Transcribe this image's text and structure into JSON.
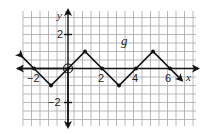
{
  "chart_data": {
    "type": "line",
    "title": "",
    "function_label": "g",
    "xlabel": "x",
    "ylabel": "y",
    "xlim": [
      -2.7,
      7.5
    ],
    "ylim": [
      -3.4,
      3.4
    ],
    "grid": true,
    "x_tick_labels": [
      "-2",
      "2",
      "4",
      "6"
    ],
    "y_tick_labels": [
      "2",
      "-2"
    ],
    "series": [
      {
        "name": "g",
        "points": [
          {
            "x": -2,
            "y": 0
          },
          {
            "x": -1,
            "y": -1
          },
          {
            "x": 0,
            "y": 0
          },
          {
            "x": 1,
            "y": 1
          },
          {
            "x": 2,
            "y": 0
          },
          {
            "x": 3,
            "y": -1
          },
          {
            "x": 4,
            "y": 0
          },
          {
            "x": 5,
            "y": 1
          },
          {
            "x": 6,
            "y": 0
          }
        ],
        "open_points": [
          {
            "x": 0,
            "y": 0
          }
        ],
        "arrows": [
          "left-up",
          "right-down"
        ]
      }
    ],
    "annotations": [
      {
        "text": "g",
        "x": 3.3,
        "y": 1.6
      }
    ]
  },
  "labels": {
    "x_axis": "x",
    "y_axis": "y",
    "function": "g",
    "x_ticks": [
      "−2",
      "2",
      "4",
      "6"
    ],
    "y_ticks": [
      "2",
      "−2"
    ]
  }
}
